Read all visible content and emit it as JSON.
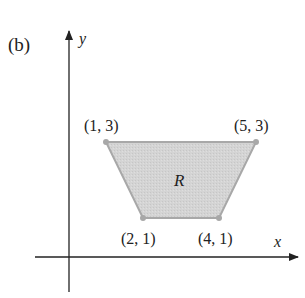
{
  "figure": {
    "panel_label": "(b)",
    "x_axis_label": "x",
    "y_axis_label": "y",
    "region_label": "R",
    "region_fill": "#d4d4d4",
    "region_stroke": "#a8a8a8",
    "axis_color": "#222222",
    "vertices": [
      {
        "label": "(1, 3)",
        "x": 1,
        "y": 3
      },
      {
        "label": "(5, 3)",
        "x": 5,
        "y": 3
      },
      {
        "label": "(4, 1)",
        "x": 4,
        "y": 1
      },
      {
        "label": "(2, 1)",
        "x": 2,
        "y": 1
      }
    ]
  }
}
